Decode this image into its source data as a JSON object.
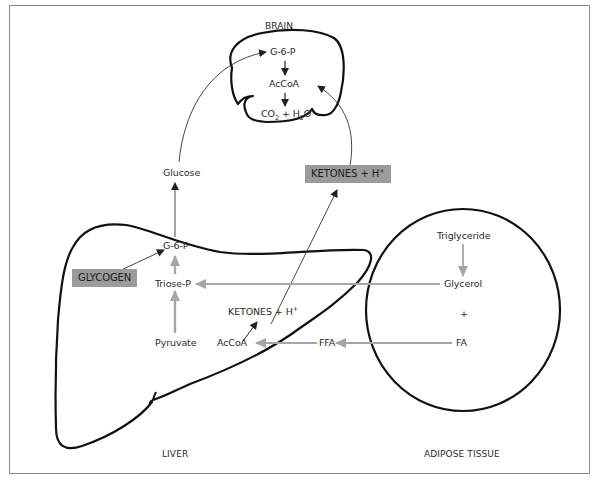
{
  "organs": {
    "brain": {
      "title": "BRAIN",
      "metabolites": {
        "g6p": "G-6-P",
        "accoa": "AcCoA",
        "co2_h2o": {
          "co": "CO",
          "sub1": "2",
          "plus_h": " + H",
          "sub2": "2",
          "o": "O"
        }
      }
    },
    "liver": {
      "title": "LIVER",
      "metabolites": {
        "glycogen": "GLYCOGEN",
        "g6p": "G-6-P",
        "triose_p": "Triose-P",
        "pyruvate": "Pyruvate",
        "accoa": "AcCoA",
        "ketones": {
          "text": "KETONES + H",
          "sup": "+"
        }
      }
    },
    "adipose": {
      "title": "ADIPOSE TISSUE",
      "metabolites": {
        "triglyceride": "Triglyceride",
        "glycerol": "Glycerol",
        "plus": "+",
        "fa": "FA"
      }
    }
  },
  "blood": {
    "glucose": "Glucose",
    "ketones": {
      "text": "KETONES + H",
      "sup": "+"
    },
    "ffa": "FFA"
  },
  "colors": {
    "organ_outline": "#111111",
    "black_arrow": "#222222",
    "gray_arrow": "#a6a6a6",
    "highlight_box": "#9b9b9b",
    "frame": "#8a8a8a"
  }
}
